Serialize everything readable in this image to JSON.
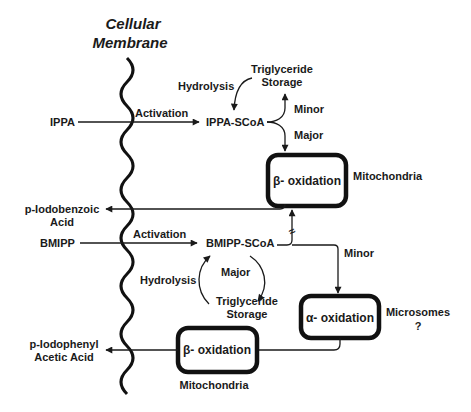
{
  "membrane": {
    "title_line1": "Cellular",
    "title_line2": "Membrane"
  },
  "ippa_pathway": {
    "substrate": "IPPA",
    "activation_label": "Activation",
    "intermediate": "IPPA-SCoA",
    "hydrolysis_label": "Hydrolysis",
    "storage_line1": "Triglyceride",
    "storage_line2": "Storage",
    "minor_label": "Minor",
    "major_label": "Major",
    "beta_box_label": "β- oxidation",
    "beta_location": "Mitochondria",
    "product_line1": "p-Iodobenzoic",
    "product_line2": "Acid"
  },
  "bmipp_pathway": {
    "substrate": "BMIPP",
    "activation_label": "Activation",
    "intermediate": "BMIPP-SCoA",
    "hydrolysis_label": "Hydrolysis",
    "major_label": "Major",
    "storage_line1": "Triglyceride",
    "storage_line2": "Storage",
    "minor_label": "Minor",
    "blocked_symbol": "≈",
    "alpha_box_label": "α- oxidation",
    "alpha_location_line1": "Microsomes",
    "alpha_location_line2": "?",
    "beta_box_label": "β- oxidation",
    "beta_location": "Mitochondria",
    "product_line1": "p-Iodophenyl",
    "product_line2": "Acetic Acid"
  },
  "colors": {
    "ink": "#1a1a1a",
    "background": "#ffffff"
  }
}
